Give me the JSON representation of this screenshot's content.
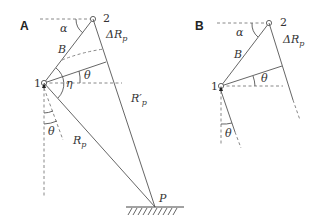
{
  "panels": [
    {
      "label": "A",
      "points": {
        "p1": "1",
        "p2": "2",
        "P": "P"
      },
      "labels": {
        "alpha": "α",
        "B": "B",
        "deltaRp": "ΔR",
        "deltaRp_sub": "p",
        "theta_top": "θ",
        "eta": "η",
        "Rp_prime": "R′",
        "Rp_prime_sub": "p",
        "theta_bottom": "θ",
        "Rp": "R",
        "Rp_sub": "p"
      }
    },
    {
      "label": "B",
      "points": {
        "p1": "1",
        "p2": "2"
      },
      "labels": {
        "alpha": "α",
        "B": "B",
        "deltaRp": "ΔR",
        "deltaRp_sub": "p",
        "theta_top": "θ",
        "theta_bottom": "θ"
      }
    }
  ]
}
